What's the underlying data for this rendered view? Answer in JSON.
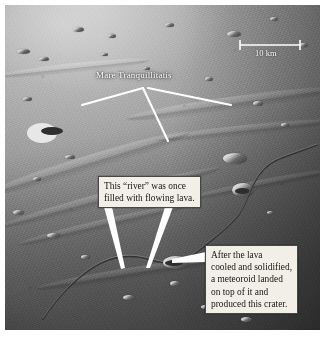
{
  "figure": {
    "type": "annotated-photograph"
  },
  "scale_bar": {
    "label": "10 km",
    "x_start": 240,
    "x_end": 300,
    "y": 45
  },
  "labels": {
    "mare": "Mare Tranquillitatis"
  },
  "callouts": [
    {
      "id": "river",
      "lines": [
        "This “river” was once",
        "filled with flowing lava."
      ]
    },
    {
      "id": "crater",
      "lines": [
        "After the lava",
        "cooled and solidified,",
        "a meteoroid landed",
        "on top of it and",
        "produced this crater."
      ]
    }
  ],
  "colors": {
    "callout_background": "#f2efe9",
    "callout_border": "#4a4742",
    "callout_text": "#17150f",
    "leader_line": "#ffffff",
    "label_text": "#ffffff",
    "page_background": "#ffffff"
  }
}
